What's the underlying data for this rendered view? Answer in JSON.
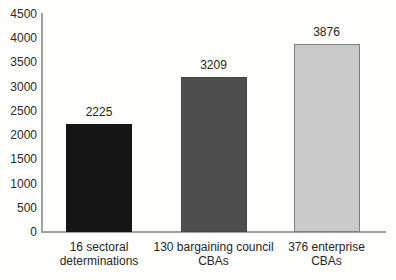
{
  "chart_data": {
    "type": "bar",
    "title": "",
    "xlabel": "",
    "ylabel": "",
    "categories": [
      "16 sectoral determinations",
      "130 bargaining council CBAs",
      "376 enterprise CBAs"
    ],
    "category_lines": [
      [
        "16 sectoral",
        "determinations"
      ],
      [
        "130 bargaining council",
        "CBAs"
      ],
      [
        "376 enterprise",
        "CBAs"
      ]
    ],
    "values": [
      2225,
      3209,
      3876
    ],
    "value_labels": [
      "2225",
      "3209",
      "3876"
    ],
    "ylim": [
      0,
      4500
    ],
    "ytick_step": 500,
    "yticks": [
      0,
      500,
      1000,
      1500,
      2000,
      2500,
      3000,
      3500,
      4000,
      4500
    ],
    "grid": false,
    "legend": "none",
    "bar_colors": [
      "#151515",
      "#4e4e4e",
      "#c9c9c9"
    ],
    "bar_border_colors": [
      "#151515",
      "#474747",
      "#7e7e7e"
    ],
    "axis_color": "#a0a0a0",
    "text_color": "#262626",
    "background_color": "#fdfdfb"
  }
}
